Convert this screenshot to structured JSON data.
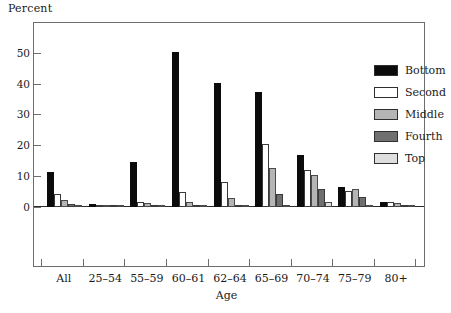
{
  "chart_data": {
    "type": "bar",
    "title": "",
    "subtitle": "",
    "xlabel": "Age",
    "ylabel": "Percent",
    "ylim": [
      0,
      57
    ],
    "yticks": [
      0,
      10,
      20,
      30,
      40,
      50
    ],
    "ytick_labels": [
      "0",
      "10",
      "20",
      "30",
      "40",
      "50"
    ],
    "grid": false,
    "legend_position": "upper right",
    "categories": [
      "All",
      "25–54",
      "55–59",
      "60–61",
      "62–64",
      "65–69",
      "70–74",
      "75–79",
      "80+"
    ],
    "series": [
      {
        "name": "Bottom",
        "color": "#0b0b0b",
        "values": [
          11.3,
          1.0,
          14.7,
          50.3,
          40.1,
          37.3,
          16.9,
          6.4,
          1.7
        ]
      },
      {
        "name": "Second",
        "color": "#ffffff",
        "values": [
          4.2,
          0.3,
          1.7,
          5.0,
          8.0,
          20.3,
          12.1,
          5.2,
          1.5
        ]
      },
      {
        "name": "Middle",
        "color": "#b5b5b5",
        "values": [
          2.4,
          0.1,
          1.2,
          1.6,
          2.9,
          12.6,
          10.3,
          5.7,
          1.2
        ]
      },
      {
        "name": "Fourth",
        "color": "#6f6f6f",
        "values": [
          1.1,
          0.1,
          0.5,
          0.8,
          0.6,
          4.1,
          5.9,
          3.4,
          0.6
        ]
      },
      {
        "name": "Top",
        "color": "#dedede",
        "values": [
          0.4,
          0.05,
          0.2,
          0.3,
          0.2,
          0.3,
          1.5,
          0.6,
          0.5
        ]
      }
    ]
  },
  "legend": {
    "items": [
      {
        "label": "Bottom"
      },
      {
        "label": "Second"
      },
      {
        "label": "Middle"
      },
      {
        "label": "Fourth"
      },
      {
        "label": "Top"
      }
    ]
  }
}
